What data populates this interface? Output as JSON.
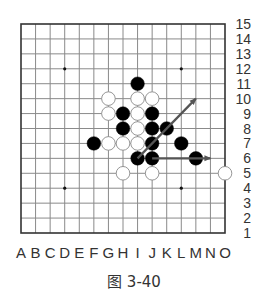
{
  "figure": {
    "caption": "图 3-40",
    "type": "gomoku-board-diagram"
  },
  "board": {
    "size": 15,
    "columns": [
      "A",
      "B",
      "C",
      "D",
      "E",
      "F",
      "G",
      "H",
      "I",
      "J",
      "K",
      "L",
      "M",
      "N",
      "O"
    ],
    "rows": [
      "15",
      "14",
      "13",
      "12",
      "11",
      "10",
      "9",
      "8",
      "7",
      "6",
      "5",
      "4",
      "3",
      "2",
      "1"
    ],
    "star_points": [
      "D12",
      "L12",
      "D4",
      "L4"
    ],
    "stones": [
      {
        "color": "black",
        "pos": "I11"
      },
      {
        "color": "white",
        "pos": "G10"
      },
      {
        "color": "white",
        "pos": "I10"
      },
      {
        "color": "white",
        "pos": "J10"
      },
      {
        "color": "white",
        "pos": "G9"
      },
      {
        "color": "black",
        "pos": "H9"
      },
      {
        "color": "white",
        "pos": "I9"
      },
      {
        "color": "black",
        "pos": "J9"
      },
      {
        "color": "black",
        "pos": "H8"
      },
      {
        "color": "white",
        "pos": "I8"
      },
      {
        "color": "black",
        "pos": "J8"
      },
      {
        "color": "black",
        "pos": "K8"
      },
      {
        "color": "black",
        "pos": "F7"
      },
      {
        "color": "white",
        "pos": "G7"
      },
      {
        "color": "white",
        "pos": "H7"
      },
      {
        "color": "white",
        "pos": "I7"
      },
      {
        "color": "black",
        "pos": "J7"
      },
      {
        "color": "black",
        "pos": "L7"
      },
      {
        "color": "black",
        "pos": "I6"
      },
      {
        "color": "black",
        "pos": "J6"
      },
      {
        "color": "black",
        "pos": "M6"
      },
      {
        "color": "white",
        "pos": "H5"
      },
      {
        "color": "white",
        "pos": "J5"
      },
      {
        "color": "white",
        "pos": "O5"
      }
    ],
    "arrows": [
      {
        "name": "diagonal-arrow",
        "from": "I6",
        "to": "M10"
      },
      {
        "name": "horizontal-arrow",
        "from": "J6",
        "to": "N6"
      }
    ]
  },
  "colors": {
    "grid_line": "#8a8a8a",
    "border": "#333333",
    "black_stone": "#000000",
    "white_stone_fill": "#ffffff",
    "white_stone_stroke": "#8a8a8a",
    "arrow": "#555555",
    "star_point": "#111111"
  }
}
